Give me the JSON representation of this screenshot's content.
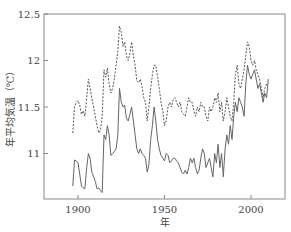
{
  "chart_data": {
    "type": "line",
    "title": "",
    "xlabel": "年",
    "ylabel": "年平均気温（℃）",
    "xlim": [
      1880,
      2015
    ],
    "ylim": [
      10.5,
      12.5
    ],
    "xticks": [
      1900,
      1950,
      2000
    ],
    "yticks": [
      11,
      11.5,
      12,
      12.5
    ],
    "ytick_labels": [
      "11",
      "11.5",
      "12",
      "12.5"
    ],
    "grid": false,
    "legend": null,
    "series": [
      {
        "name": "dashed-series",
        "style": "dashed",
        "color": "#555555",
        "x": [
          1897,
          1898,
          1899,
          1900,
          1901,
          1902,
          1903,
          1904,
          1905,
          1906,
          1907,
          1908,
          1909,
          1910,
          1911,
          1912,
          1913,
          1914,
          1915,
          1916,
          1917,
          1918,
          1919,
          1920,
          1921,
          1922,
          1923,
          1924,
          1925,
          1926,
          1927,
          1928,
          1929,
          1930,
          1931,
          1932,
          1933,
          1934,
          1935,
          1936,
          1937,
          1938,
          1939,
          1940,
          1941,
          1942,
          1943,
          1944,
          1945,
          1946,
          1947,
          1948,
          1949,
          1950,
          1951,
          1952,
          1953,
          1954,
          1955,
          1956,
          1957,
          1958,
          1959,
          1960,
          1961,
          1962,
          1963,
          1964,
          1965,
          1966,
          1967,
          1968,
          1969,
          1970,
          1971,
          1972,
          1973,
          1974,
          1975,
          1976,
          1977,
          1978,
          1979,
          1980,
          1981,
          1982,
          1983,
          1984,
          1985,
          1986,
          1987,
          1988,
          1989,
          1990,
          1991,
          1992,
          1993,
          1994,
          1995,
          1996,
          1997,
          1998,
          1999,
          2000,
          2001,
          2002,
          2003,
          2004,
          2005,
          2006,
          2007,
          2008,
          2009,
          2010
        ],
        "values": [
          11.22,
          11.5,
          11.55,
          11.57,
          11.52,
          11.42,
          11.46,
          11.4,
          11.6,
          11.8,
          11.7,
          11.6,
          11.5,
          11.4,
          11.3,
          11.22,
          11.25,
          11.4,
          11.9,
          11.82,
          11.92,
          11.75,
          11.65,
          11.7,
          11.8,
          11.95,
          12.1,
          12.37,
          12.3,
          12.15,
          12.2,
          12.05,
          12.0,
          12.08,
          12.2,
          12.05,
          11.95,
          11.78,
          11.76,
          11.8,
          11.72,
          11.6,
          11.55,
          11.35,
          11.5,
          11.7,
          11.85,
          11.95,
          11.95,
          11.82,
          11.7,
          11.55,
          11.45,
          11.3,
          11.35,
          11.5,
          11.55,
          11.5,
          11.58,
          11.6,
          11.55,
          11.5,
          11.55,
          11.45,
          11.42,
          11.4,
          11.5,
          11.6,
          11.55,
          11.55,
          11.45,
          11.4,
          11.5,
          11.45,
          11.55,
          11.5,
          11.5,
          11.4,
          11.35,
          11.5,
          11.45,
          11.5,
          11.6,
          11.55,
          11.65,
          11.45,
          11.55,
          11.35,
          11.45,
          11.6,
          11.5,
          11.4,
          11.35,
          11.55,
          11.85,
          11.95,
          11.75,
          11.7,
          11.8,
          11.9,
          12.05,
          12.2,
          12.15,
          12.0,
          11.95,
          12.0,
          11.9,
          11.85,
          11.8,
          11.7,
          11.6,
          11.7,
          11.75,
          11.75
        ]
      },
      {
        "name": "solid-series",
        "style": "solid",
        "color": "#666666",
        "x": [
          1897,
          1898,
          1899,
          1900,
          1901,
          1902,
          1903,
          1904,
          1905,
          1906,
          1907,
          1908,
          1909,
          1910,
          1911,
          1912,
          1913,
          1914,
          1915,
          1916,
          1917,
          1918,
          1919,
          1920,
          1921,
          1922,
          1923,
          1924,
          1925,
          1926,
          1927,
          1928,
          1929,
          1930,
          1931,
          1932,
          1933,
          1934,
          1935,
          1936,
          1937,
          1938,
          1939,
          1940,
          1941,
          1942,
          1943,
          1944,
          1945,
          1946,
          1947,
          1948,
          1949,
          1950,
          1951,
          1952,
          1953,
          1954,
          1955,
          1956,
          1957,
          1958,
          1959,
          1960,
          1961,
          1962,
          1963,
          1964,
          1965,
          1966,
          1967,
          1968,
          1969,
          1970,
          1971,
          1972,
          1973,
          1974,
          1975,
          1976,
          1977,
          1978,
          1979,
          1980,
          1981,
          1982,
          1983,
          1984,
          1985,
          1986,
          1987,
          1988,
          1989,
          1990,
          1991,
          1992,
          1993,
          1994,
          1995,
          1996,
          1997,
          1998,
          1999,
          2000,
          2001,
          2002,
          2003,
          2004,
          2005,
          2006,
          2007,
          2008,
          2009,
          2010
        ],
        "values": [
          10.65,
          10.93,
          10.92,
          10.9,
          10.78,
          10.65,
          10.63,
          10.62,
          10.85,
          11.0,
          10.95,
          10.8,
          10.75,
          10.7,
          10.62,
          10.63,
          10.6,
          10.58,
          11.2,
          11.15,
          11.3,
          11.2,
          10.98,
          11.0,
          11.02,
          11.05,
          11.2,
          11.7,
          11.55,
          11.5,
          11.52,
          11.38,
          11.35,
          11.42,
          11.5,
          11.35,
          11.2,
          11.05,
          11.0,
          11.05,
          11.0,
          10.98,
          10.95,
          10.8,
          10.88,
          11.15,
          11.3,
          11.5,
          11.35,
          11.15,
          11.05,
          10.98,
          10.95,
          10.92,
          11.0,
          10.98,
          10.9,
          10.92,
          10.95,
          10.95,
          10.92,
          10.9,
          10.85,
          10.8,
          10.78,
          10.82,
          10.78,
          10.85,
          10.95,
          10.9,
          10.95,
          10.85,
          10.78,
          10.82,
          10.95,
          11.05,
          11.0,
          10.85,
          10.9,
          10.95,
          10.85,
          10.75,
          11.0,
          10.9,
          11.1,
          10.85,
          11.0,
          10.75,
          11.05,
          11.2,
          11.1,
          11.3,
          11.15,
          11.4,
          11.55,
          11.45,
          11.6,
          11.55,
          11.5,
          11.4,
          11.75,
          11.95,
          11.85,
          11.8,
          11.85,
          11.9,
          11.8,
          11.7,
          11.75,
          11.65,
          11.55,
          11.65,
          11.6,
          11.8
        ]
      }
    ]
  },
  "layout": {
    "plot_left": 44,
    "plot_top": 14,
    "plot_right": 285,
    "plot_bottom": 199,
    "x_origin_year": 1900,
    "x_origin_px": 78,
    "px_per_year": 1.73,
    "y_ref_value": 12.5,
    "px_per_unit": 93
  }
}
